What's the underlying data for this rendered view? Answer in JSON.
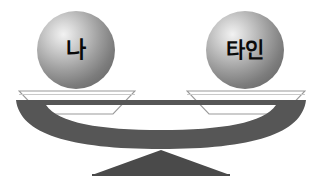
{
  "diagram": {
    "type": "balance-scale",
    "title": "",
    "background_color": "#ffffff",
    "beam_color": "#565656",
    "fulcrum_color": "#4a4a4a",
    "pan_fill_color": "#ffffff",
    "pan_outline_color": "#9a9a9a",
    "sphere_highlight_color": "#f2f2f2",
    "sphere_shadow_color": "#626262",
    "label_color": "#0a0a0a",
    "state": "balanced",
    "left": {
      "label": "나",
      "pan_name": "left-pan"
    },
    "right": {
      "label": "타인",
      "pan_name": "right-pan"
    }
  }
}
